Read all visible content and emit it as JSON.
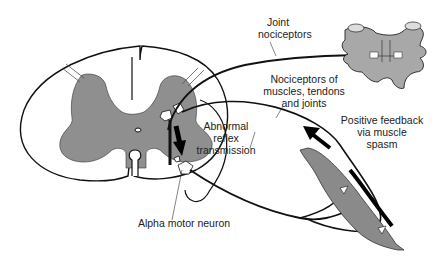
{
  "diagram": {
    "colors": {
      "gray_matter": "#8f8f8f",
      "vertebra": "#a8a8a8",
      "muscle": "#8a8a8a",
      "outline": "#111111",
      "background": "#ffffff"
    },
    "labels": {
      "joint_nociceptors": "Joint\nnociceptors",
      "joint_nociceptors_line1": "Joint",
      "joint_nociceptors_line2": "nociceptors",
      "muscle_nociceptors_line1": "Nociceptors of",
      "muscle_nociceptors_line2": "muscles, tendons",
      "muscle_nociceptors_line3": "and joints",
      "abnormal_line1": "Abnormal",
      "abnormal_line2": "reflex",
      "abnormal_line3": "transmission",
      "feedback_line1": "Positive feedback",
      "feedback_line2": "via muscle",
      "feedback_line3": "spasm",
      "alpha_motor_neuron": "Alpha motor neuron"
    },
    "nodes": [
      {
        "id": "spinal-cord",
        "label": "Spinal cord cross-section"
      },
      {
        "id": "vertebra",
        "label": "Vertebra"
      },
      {
        "id": "muscle",
        "label": "Muscle"
      },
      {
        "id": "alpha-motor-neuron",
        "label": "Alpha motor neuron"
      }
    ],
    "edges": [
      {
        "from": "vertebra",
        "to": "spinal-cord",
        "label": "Joint nociceptors"
      },
      {
        "from": "muscle",
        "to": "spinal-cord",
        "label": "Nociceptors of muscles, tendons and joints"
      },
      {
        "from": "spinal-cord",
        "to": "muscle",
        "label": "Alpha motor neuron"
      },
      {
        "from": "muscle",
        "to": "spinal-cord",
        "label": "Positive feedback via muscle spasm"
      }
    ]
  }
}
